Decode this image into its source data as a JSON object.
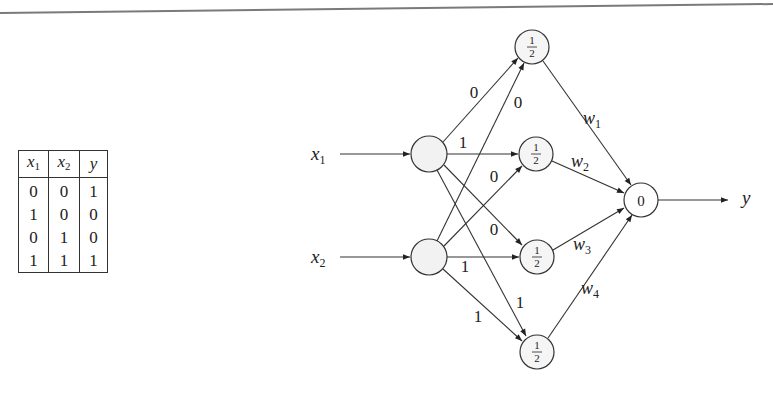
{
  "truth_table": {
    "headers": [
      {
        "var": "x",
        "sub": "1"
      },
      {
        "var": "x",
        "sub": "2"
      },
      {
        "var": "y",
        "sub": ""
      }
    ],
    "rows": [
      [
        "0",
        "0",
        "1"
      ],
      [
        "1",
        "0",
        "0"
      ],
      [
        "0",
        "1",
        "0"
      ],
      [
        "1",
        "1",
        "1"
      ]
    ]
  },
  "network": {
    "inputs": [
      {
        "var": "x",
        "sub": "1"
      },
      {
        "var": "x",
        "sub": "2"
      }
    ],
    "hidden_nodes": [
      {
        "threshold_num": "1",
        "threshold_den": "2"
      },
      {
        "threshold_num": "1",
        "threshold_den": "2"
      },
      {
        "threshold_num": "1",
        "threshold_den": "2"
      },
      {
        "threshold_num": "1",
        "threshold_den": "2"
      }
    ],
    "input_to_hidden_weights": {
      "x1_h1": "0",
      "x2_h1": "0",
      "x1_h2": "1",
      "x2_h2": "0",
      "x1_h3": "0",
      "x2_h3": "1",
      "x1_h4": "1",
      "x2_h4": "1"
    },
    "hidden_to_output_weights": [
      {
        "var": "w",
        "sub": "1"
      },
      {
        "var": "w",
        "sub": "2"
      },
      {
        "var": "w",
        "sub": "3"
      },
      {
        "var": "w",
        "sub": "4"
      }
    ],
    "output_node": {
      "threshold": "0"
    },
    "output_label": "y"
  },
  "colors": {
    "stroke": "#333333",
    "node_fill": "#f4f4f4",
    "top_rule": "#777777"
  }
}
